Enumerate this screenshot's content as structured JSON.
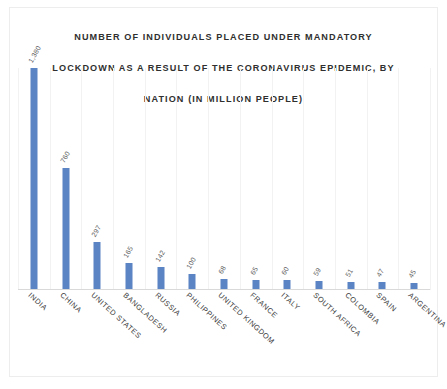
{
  "chart_data": {
    "type": "bar",
    "title": "NUMBER OF INDIVIDUALS PLACED UNDER MANDATORY LOCKDOWN AS A RESULT OF THE CORONAVIRUS EPIDEMIC, BY NATION (IN MILLION PEOPLE)",
    "title_lines": [
      "NUMBER OF INDIVIDUALS PLACED UNDER MANDATORY",
      "LOCKDOWN AS A RESULT OF THE CORONAVIRUS EPIDEMIC, BY",
      "NATION (IN MILLION PEOPLE)"
    ],
    "xlabel": "",
    "ylabel": "",
    "unit": "million people",
    "ylim": [
      0,
      1380
    ],
    "grid": "vertical-category-separators",
    "legend": "none",
    "axis_y_visible": false,
    "axis_x_baseline_visible": true,
    "bar_color": "#5b84c5",
    "data_label_color": "#5d5d5d",
    "category_label_color": "#3b3b3b",
    "title_color": "#2f2f2f",
    "background_color": "#ffffff",
    "categories": [
      "INDIA",
      "CHINA",
      "UNITED STATES",
      "BANGLADESH",
      "RUSSIA",
      "PHILIPPINES",
      "UNITED KINGDOM",
      "FRANCE",
      "ITALY",
      "SOUTH AFRICA",
      "COLOMBIA",
      "SPAIN",
      "ARGENTINA"
    ],
    "values": [
      1380,
      760,
      297,
      165,
      142,
      100,
      68,
      65,
      60,
      59,
      51,
      47,
      45
    ],
    "value_labels": [
      "1,380",
      "760",
      "297",
      "165",
      "142",
      "100",
      "68",
      "65",
      "60",
      "59",
      "51",
      "47",
      "45"
    ],
    "points": [
      {
        "category": "INDIA",
        "value": 1380,
        "label": "1,380"
      },
      {
        "category": "CHINA",
        "value": 760,
        "label": "760"
      },
      {
        "category": "UNITED STATES",
        "value": 297,
        "label": "297"
      },
      {
        "category": "BANGLADESH",
        "value": 165,
        "label": "165"
      },
      {
        "category": "RUSSIA",
        "value": 142,
        "label": "142"
      },
      {
        "category": "PHILIPPINES",
        "value": 100,
        "label": "100"
      },
      {
        "category": "UNITED KINGDOM",
        "value": 68,
        "label": "68"
      },
      {
        "category": "FRANCE",
        "value": 65,
        "label": "65"
      },
      {
        "category": "ITALY",
        "value": 60,
        "label": "60"
      },
      {
        "category": "SOUTH AFRICA",
        "value": 59,
        "label": "59"
      },
      {
        "category": "COLOMBIA",
        "value": 51,
        "label": "51"
      },
      {
        "category": "SPAIN",
        "value": 47,
        "label": "47"
      },
      {
        "category": "ARGENTINA",
        "value": 45,
        "label": "45"
      }
    ]
  }
}
